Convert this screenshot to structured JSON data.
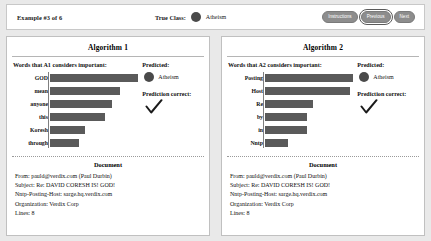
{
  "header": {
    "example_counter": "Example #3 of 6",
    "true_class_label": "True Class:",
    "true_class_value": "Atheism",
    "true_class_color": "#4a4a4a",
    "buttons": [
      {
        "label": "Instructions",
        "name": "instructions-button"
      },
      {
        "label": "Previous",
        "name": "previous-button"
      },
      {
        "label": "Next",
        "name": "next-button"
      }
    ]
  },
  "panels": [
    {
      "title": "Algorithm 1",
      "words_heading": "Words that A1 considers important:",
      "predicted_heading": "Predicted:",
      "predicted_value": "Atheism",
      "predicted_color": "#4a4a4a",
      "correct_heading": "Prediction correct:",
      "correct_mark": "check-icon",
      "document_title": "Document",
      "document_lines": [
        "From: pauld@verdix.com (Paul Durbin)",
        "Subject: Re: DAVID CORESH IS! GOD!",
        "Nntp-Posting-Host: sarge.hq.verdix.com",
        "Organization: Verdix Corp",
        "Lines: 8"
      ]
    },
    {
      "title": "Algorithm 2",
      "words_heading": "Words that A2 considers important:",
      "predicted_heading": "Predicted:",
      "predicted_value": "Atheism",
      "predicted_color": "#4a4a4a",
      "correct_heading": "Prediction correct:",
      "correct_mark": "check-icon",
      "document_title": "Document",
      "document_lines": [
        "From: pauld@verdix.com (Paul Durbin)",
        "Subject: Re: DAVID CORESH IS! GOD!",
        "Nntp-Posting-Host: sarge.hq.verdix.com",
        "Organization: Verdix Corp",
        "Lines: 8"
      ]
    }
  ],
  "chart_data": [
    {
      "type": "bar",
      "title": "Words that A1 considers important:",
      "orientation": "horizontal",
      "categories": [
        "GOD",
        "mean",
        "anyone",
        "this",
        "Koresh",
        "through"
      ],
      "values": [
        100,
        79,
        70,
        62,
        40,
        33
      ],
      "xlabel": "",
      "ylabel": "",
      "xlim": [
        0,
        100
      ],
      "grid": false,
      "legend": false,
      "bar_color": "#5a5a5a"
    },
    {
      "type": "bar",
      "title": "Words that A2 considers important:",
      "orientation": "horizontal",
      "categories": [
        "Posting",
        "Host",
        "Re",
        "by",
        "in",
        "Nntp"
      ],
      "values": [
        100,
        96,
        54,
        48,
        48,
        26
      ],
      "xlabel": "",
      "ylabel": "",
      "xlim": [
        0,
        100
      ],
      "grid": false,
      "legend": false,
      "bar_color": "#5a5a5a"
    }
  ]
}
